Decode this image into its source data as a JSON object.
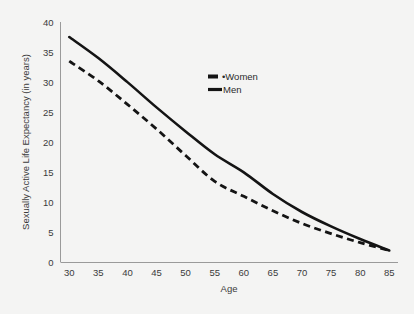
{
  "chart_data": {
    "type": "line",
    "title": "",
    "xlabel": "Age",
    "ylabel": "Sexually Active Life Expectancy (in years)",
    "x": [
      30,
      35,
      40,
      45,
      50,
      55,
      60,
      65,
      70,
      75,
      80,
      85
    ],
    "xlim": [
      28.5,
      86.5
    ],
    "ylim": [
      0,
      40
    ],
    "xticks": [
      "30",
      "35",
      "40",
      "45",
      "50",
      "55",
      "60",
      "65",
      "70",
      "75",
      "80",
      "85"
    ],
    "yticks": [
      "0",
      "5",
      "10",
      "15",
      "20",
      "25",
      "30",
      "35",
      "40"
    ],
    "grid": false,
    "legend_position": "upper-center",
    "series": [
      {
        "name": "Women",
        "style": "dashed",
        "values": [
          33.5,
          30.2,
          26.3,
          22.2,
          17.8,
          13.5,
          11.0,
          8.6,
          6.5,
          4.8,
          3.3,
          2.0
        ]
      },
      {
        "name": "Men",
        "style": "solid",
        "values": [
          37.5,
          34.0,
          30.0,
          25.8,
          21.8,
          18.0,
          15.0,
          11.4,
          8.4,
          6.0,
          3.9,
          2.0
        ]
      }
    ]
  },
  "legend": {
    "women_label": "Women",
    "men_label": "Men",
    "women_marker_prefix": "•"
  },
  "axes": {
    "x_title": "Age",
    "y_title": "Sexually Active Life Expectancy (in years)"
  },
  "colors": {
    "background": "#f4f4f3",
    "line": "#141414",
    "axis": "#9a9a9a",
    "text": "#3b3b3b"
  }
}
